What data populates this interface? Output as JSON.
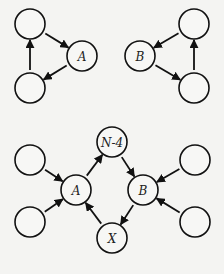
{
  "diagram": {
    "node_radius": 15,
    "nodes": [
      {
        "id": "t1_top",
        "label": "",
        "x": 30,
        "y": 24
      },
      {
        "id": "t1_A",
        "label": "A",
        "x": 82,
        "y": 56
      },
      {
        "id": "t1_bot",
        "label": "",
        "x": 30,
        "y": 88
      },
      {
        "id": "t2_B",
        "label": "B",
        "x": 140,
        "y": 56
      },
      {
        "id": "t2_top",
        "label": "",
        "x": 194,
        "y": 24
      },
      {
        "id": "t2_bot",
        "label": "",
        "x": 194,
        "y": 88
      },
      {
        "id": "b_lt",
        "label": "",
        "x": 30,
        "y": 160
      },
      {
        "id": "b_lb",
        "label": "",
        "x": 30,
        "y": 222
      },
      {
        "id": "b_A",
        "label": "A",
        "x": 76,
        "y": 190
      },
      {
        "id": "b_N4",
        "label": "N-4",
        "x": 112,
        "y": 142
      },
      {
        "id": "b_B",
        "label": "B",
        "x": 143,
        "y": 190
      },
      {
        "id": "b_X",
        "label": "X",
        "x": 112,
        "y": 238
      },
      {
        "id": "b_rt",
        "label": "",
        "x": 195,
        "y": 160
      },
      {
        "id": "b_rb",
        "label": "",
        "x": 195,
        "y": 222
      }
    ],
    "edges": [
      {
        "from": "t1_top",
        "to": "t1_A"
      },
      {
        "from": "t1_A",
        "to": "t1_bot"
      },
      {
        "from": "t1_bot",
        "to": "t1_top"
      },
      {
        "from": "t2_top",
        "to": "t2_B"
      },
      {
        "from": "t2_B",
        "to": "t2_bot"
      },
      {
        "from": "t2_bot",
        "to": "t2_top"
      },
      {
        "from": "b_lt",
        "to": "b_A"
      },
      {
        "from": "b_lb",
        "to": "b_A"
      },
      {
        "from": "b_A",
        "to": "b_N4"
      },
      {
        "from": "b_N4",
        "to": "b_B"
      },
      {
        "from": "b_B",
        "to": "b_X"
      },
      {
        "from": "b_X",
        "to": "b_A"
      },
      {
        "from": "b_rt",
        "to": "b_B"
      },
      {
        "from": "b_rb",
        "to": "b_B"
      }
    ]
  }
}
